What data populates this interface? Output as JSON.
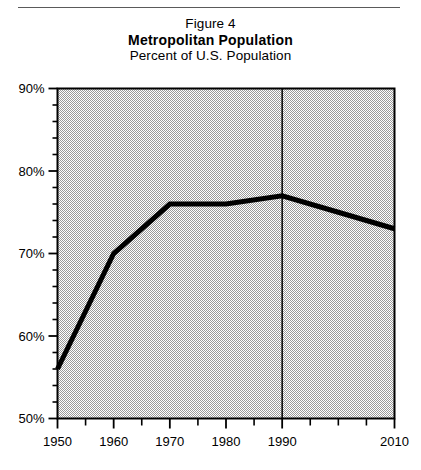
{
  "figure": {
    "figure_number_label": "Figure 4",
    "title": "Metropolitan  Population",
    "subtitle": "Percent of U.S. Population"
  },
  "chart_data": {
    "type": "line",
    "title": "Metropolitan Population",
    "subtitle": "Percent of U.S. Population",
    "xlabel": "",
    "ylabel": "",
    "x": [
      1950,
      1960,
      1970,
      1980,
      1990,
      2000,
      2010
    ],
    "values": [
      56,
      70,
      76,
      76,
      77,
      75,
      73
    ],
    "series": [
      {
        "name": "Metropolitan Population",
        "values": [
          56,
          70,
          76,
          76,
          77,
          75,
          73
        ]
      }
    ],
    "xlim": [
      1950,
      2010
    ],
    "ylim": [
      50,
      90
    ],
    "y_tick_values": [
      50,
      60,
      70,
      80,
      90
    ],
    "y_tick_labels": [
      "50%",
      "60%",
      "70%",
      "80%",
      "90%"
    ],
    "y_minor_step": 2,
    "x_tick_values": [
      1950,
      1955,
      1960,
      1965,
      1970,
      1975,
      1980,
      1985,
      1990,
      1995,
      2000,
      2005,
      2010
    ],
    "x_tick_labels_shown": [
      "1950",
      "1960",
      "1970",
      "1980",
      "1990",
      "2010"
    ],
    "x_labeled_values": [
      1950,
      1960,
      1970,
      1980,
      1990,
      2010
    ],
    "grid": false,
    "plot_background": "dither-gray",
    "divider_line_year": 1990,
    "legend": "none",
    "line_color": "#000000",
    "line_width_px": 5
  },
  "colors": {
    "line": "#000000",
    "plot_border": "#000000",
    "plot_fill": "#c8c8c8",
    "rule": "#5a5a5a",
    "text": "#000000"
  },
  "icons": {
    "divider": "vertical-divider-line"
  }
}
